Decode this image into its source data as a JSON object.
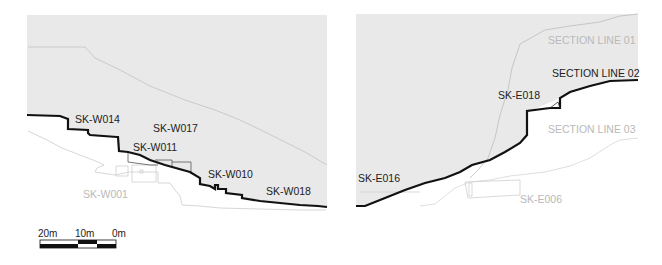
{
  "colors": {
    "panel_fill": "#e9e9e9",
    "section_line_primary": "#111111",
    "section_line_secondary": "#b0b0b0",
    "section_line_faint": "#d2d2d2",
    "label_dark": "#222222",
    "label_light": "#b9b9b9"
  },
  "west_panel": {
    "labels": {
      "w014": "SK-W014",
      "w017": "SK-W017",
      "w011": "SK-W011",
      "w010": "SK-W010",
      "w018": "SK-W018",
      "w001": "SK-W001"
    }
  },
  "east_panel": {
    "labels": {
      "section_line_01": "SECTION LINE 01",
      "section_line_02": "SECTION LINE 02",
      "section_line_03": "SECTION LINE 03",
      "e018": "SK-E018",
      "e016": "SK-E016",
      "e006": "SK-E006"
    }
  },
  "scale_bar": {
    "ticks": [
      "20m",
      "10m",
      "0m"
    ]
  }
}
